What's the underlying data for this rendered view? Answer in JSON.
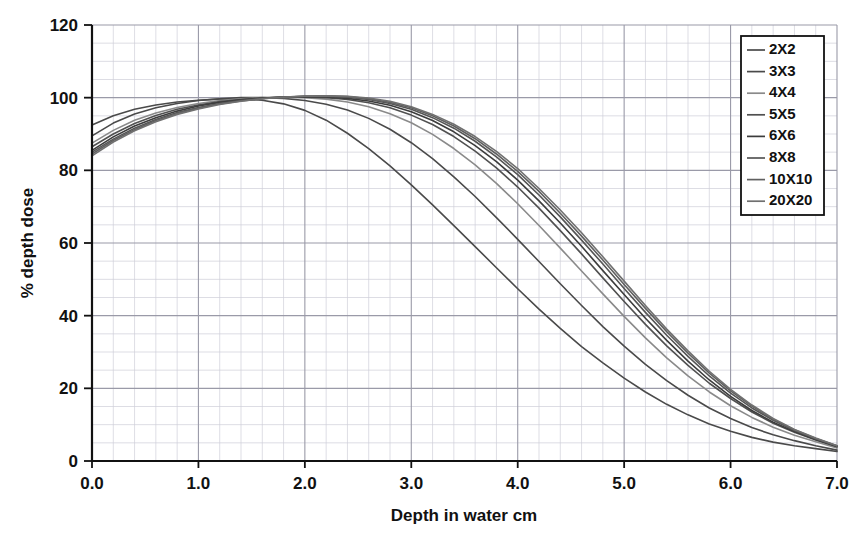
{
  "chart_data": {
    "type": "line",
    "title": "",
    "xlabel": "Depth in water cm",
    "ylabel": "% depth dose",
    "xlim": [
      0.0,
      7.0
    ],
    "ylim": [
      0,
      120
    ],
    "xticks": [
      "0.0",
      "1.0",
      "2.0",
      "3.0",
      "4.0",
      "5.0",
      "6.0",
      "7.0"
    ],
    "yticks": [
      "0",
      "20",
      "40",
      "60",
      "80",
      "100",
      "120"
    ],
    "grid": true,
    "minor_grid": true,
    "x_minor_divisions": 5,
    "y_minor_divisions": 4,
    "legend_position": "top-right",
    "legend_entries": [
      "2X2",
      "3X3",
      "4X4",
      "5X5",
      "6X6",
      "8X8",
      "10X10",
      "20X20"
    ],
    "x": [
      0.0,
      0.2,
      0.4,
      0.6,
      0.8,
      1.0,
      1.2,
      1.4,
      1.6,
      1.8,
      2.0,
      2.2,
      2.4,
      2.6,
      2.8,
      3.0,
      3.2,
      3.4,
      3.6,
      3.8,
      4.0,
      4.2,
      4.4,
      4.6,
      4.8,
      5.0,
      5.2,
      5.4,
      5.6,
      5.8,
      6.0,
      6.2,
      6.4,
      6.6,
      6.8,
      7.0
    ],
    "series": [
      {
        "name": "2X2",
        "color": "#4a4a4a",
        "values": [
          92.5,
          95.0,
          96.8,
          98.0,
          98.8,
          99.3,
          99.6,
          99.6,
          99.3,
          98.3,
          96.5,
          93.8,
          90.2,
          86.0,
          81.2,
          76.0,
          70.5,
          64.8,
          59.0,
          53.2,
          47.4,
          41.8,
          36.5,
          31.5,
          27.0,
          22.8,
          19.0,
          15.6,
          12.7,
          10.2,
          8.2,
          6.5,
          5.2,
          4.2,
          3.4,
          2.6
        ]
      },
      {
        "name": "3X3",
        "color": "#4a4a4a",
        "values": [
          89.5,
          93.0,
          95.5,
          97.2,
          98.4,
          99.2,
          99.7,
          100.0,
          100.0,
          99.8,
          99.2,
          98.2,
          96.6,
          94.3,
          91.3,
          87.6,
          83.2,
          78.2,
          72.8,
          67.0,
          61.0,
          54.9,
          48.8,
          42.8,
          37.0,
          31.6,
          26.6,
          22.1,
          18.1,
          14.6,
          11.7,
          9.2,
          7.2,
          5.6,
          4.2,
          3.0
        ]
      },
      {
        "name": "4X4",
        "color": "#8a8a8a",
        "values": [
          87.5,
          91.0,
          93.8,
          95.8,
          97.3,
          98.4,
          99.2,
          99.7,
          100.0,
          100.1,
          100.0,
          99.6,
          98.8,
          97.5,
          95.6,
          93.1,
          89.9,
          86.0,
          81.5,
          76.4,
          70.8,
          64.8,
          58.6,
          52.3,
          46.0,
          39.8,
          33.9,
          28.4,
          23.4,
          19.0,
          15.2,
          12.0,
          9.3,
          7.1,
          5.3,
          3.6
        ]
      },
      {
        "name": "5X5",
        "color": "#505050",
        "values": [
          86.5,
          90.0,
          92.9,
          95.1,
          96.8,
          98.0,
          98.9,
          99.5,
          99.9,
          100.1,
          100.2,
          100.0,
          99.5,
          98.6,
          97.2,
          95.2,
          92.6,
          89.3,
          85.3,
          80.7,
          75.4,
          69.6,
          63.4,
          57.0,
          50.4,
          43.9,
          37.6,
          31.7,
          26.3,
          21.4,
          17.2,
          13.5,
          10.4,
          7.9,
          5.8,
          3.9
        ]
      },
      {
        "name": "6X6",
        "color": "#3c3c3c",
        "values": [
          85.5,
          89.2,
          92.2,
          94.5,
          96.3,
          97.7,
          98.7,
          99.4,
          99.9,
          100.2,
          100.3,
          100.2,
          99.8,
          99.1,
          97.9,
          96.1,
          93.7,
          90.6,
          86.8,
          82.4,
          77.3,
          71.6,
          65.5,
          59.1,
          52.4,
          45.8,
          39.3,
          33.2,
          27.5,
          22.3,
          17.8,
          13.9,
          10.7,
          8.1,
          5.9,
          4.0
        ]
      },
      {
        "name": "8X8",
        "color": "#555555",
        "values": [
          85.0,
          88.6,
          91.6,
          94.0,
          95.9,
          97.3,
          98.4,
          99.2,
          99.8,
          100.2,
          100.4,
          100.4,
          100.1,
          99.5,
          98.4,
          96.8,
          94.5,
          91.6,
          88.0,
          83.7,
          78.8,
          73.2,
          67.2,
          60.8,
          54.2,
          47.5,
          40.9,
          34.6,
          28.8,
          23.4,
          18.7,
          14.6,
          11.2,
          8.4,
          6.1,
          4.1
        ]
      },
      {
        "name": "10X10",
        "color": "#606060",
        "values": [
          84.5,
          88.2,
          91.2,
          93.7,
          95.6,
          97.1,
          98.3,
          99.1,
          99.7,
          100.2,
          100.4,
          100.5,
          100.3,
          99.7,
          98.7,
          97.2,
          95.0,
          92.2,
          88.7,
          84.5,
          79.7,
          74.2,
          68.2,
          61.9,
          55.3,
          48.6,
          42.0,
          35.6,
          29.7,
          24.2,
          19.3,
          15.1,
          11.5,
          8.6,
          6.2,
          4.2
        ]
      },
      {
        "name": "20X20",
        "color": "#707070",
        "values": [
          84.0,
          87.8,
          90.9,
          93.4,
          95.4,
          96.9,
          98.1,
          99.0,
          99.7,
          100.1,
          100.4,
          100.5,
          100.4,
          99.9,
          99.0,
          97.5,
          95.4,
          92.7,
          89.3,
          85.2,
          80.5,
          75.0,
          69.1,
          62.8,
          56.2,
          49.5,
          42.8,
          36.3,
          30.3,
          24.7,
          19.7,
          15.4,
          11.7,
          8.7,
          6.3,
          4.2
        ]
      }
    ]
  },
  "style": {
    "axis_color": "#111111",
    "major_grid_color": "#9a9aa8",
    "minor_grid_color": "#cfcfd8",
    "background": "#ffffff",
    "legend_border_color": "#111111"
  }
}
